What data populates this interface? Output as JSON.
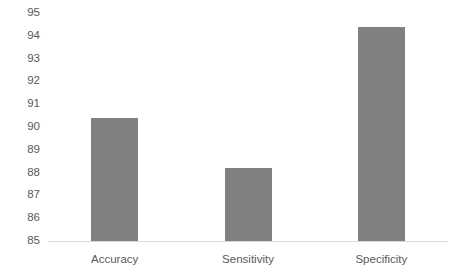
{
  "chart_data": {
    "type": "bar",
    "title": "",
    "subtitle": "",
    "xlabel": "",
    "ylabel": "",
    "categories": [
      "Accuracy",
      "Sensitivity",
      "Specificity"
    ],
    "values": [
      90.4,
      88.2,
      94.4
    ],
    "ylim": [
      85,
      95
    ],
    "ytick_labels": [
      "95",
      "94",
      "93",
      "92",
      "91",
      "90",
      "89",
      "88",
      "87",
      "86",
      "85"
    ],
    "ytick_values": [
      95,
      94,
      93,
      92,
      91,
      90,
      89,
      88,
      87,
      86,
      85
    ],
    "grid": false,
    "legend": null,
    "legend_position": "none",
    "bar_color": "#808080",
    "axis_color": "#d9d9d9",
    "tick_label_color": "#595959",
    "background_color": "#ffffff"
  }
}
